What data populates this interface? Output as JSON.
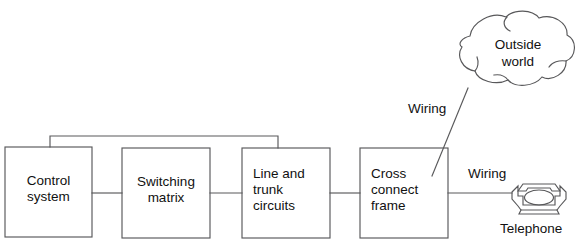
{
  "diagram": {
    "stroke_color": "#58585a",
    "text_color": "#111111",
    "background": "#ffffff",
    "boxes": [
      {
        "id": "control-system",
        "label": "Control\nsystem",
        "align": "center",
        "x": 5,
        "y": 147,
        "w": 87,
        "h": 90
      },
      {
        "id": "switching-matrix",
        "label": "Switching\nmatrix",
        "align": "center",
        "x": 122,
        "y": 148,
        "w": 88,
        "h": 90
      },
      {
        "id": "line-and-trunk-circuits",
        "label": "Line and\ntrunk\ncircuits",
        "align": "left",
        "x": 242,
        "y": 148,
        "w": 88,
        "h": 90
      },
      {
        "id": "cross-connect-frame",
        "label": "Cross\nconnect\nframe",
        "align": "left",
        "x": 360,
        "y": 148,
        "w": 88,
        "h": 90
      }
    ],
    "cloud": {
      "id": "outside-world",
      "label": "Outside\nworld"
    },
    "telephone": {
      "id": "telephone",
      "label": "Telephone"
    },
    "annotations": [
      {
        "id": "wiring-outside-world",
        "label": "Wiring"
      },
      {
        "id": "wiring-telephone",
        "label": "Wiring"
      }
    ],
    "connections": [
      {
        "id": "control-to-switching",
        "type": "horizontal"
      },
      {
        "id": "switching-to-line-trunk",
        "type": "horizontal"
      },
      {
        "id": "line-trunk-to-cross-connect",
        "type": "horizontal"
      },
      {
        "id": "cross-connect-to-telephone",
        "type": "horizontal"
      },
      {
        "id": "control-to-line-trunk-overhead",
        "type": "bus"
      },
      {
        "id": "cross-connect-to-outside-world",
        "type": "diagonal"
      }
    ]
  }
}
